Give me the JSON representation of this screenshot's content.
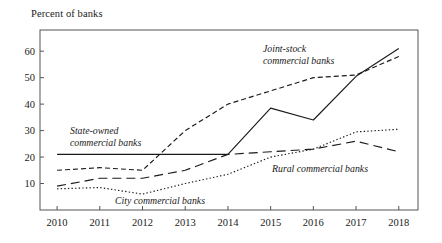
{
  "chart_data": {
    "type": "line",
    "title": "",
    "ylabel": "Percent of banks",
    "xlabel": "",
    "x": [
      2010,
      2011,
      2012,
      2013,
      2014,
      2015,
      2016,
      2017,
      2018
    ],
    "xtick_labels": [
      "2010",
      "2011",
      "2012",
      "2013",
      "2014",
      "2015",
      "2016",
      "2017",
      "2018"
    ],
    "ytick_labels": [
      "10",
      "20",
      "30",
      "40",
      "50",
      "60"
    ],
    "yticks": [
      10,
      20,
      30,
      40,
      50,
      60
    ],
    "ylim": [
      0,
      68
    ],
    "xlim": [
      2009.6,
      2018.45
    ],
    "grid": false,
    "legend_position": "inline-annotations",
    "series": [
      {
        "name": "State-owned commercial banks",
        "style": "solid",
        "values": [
          21,
          21,
          21,
          21,
          21,
          38.5,
          34,
          50.5,
          61
        ]
      },
      {
        "name": "Joint-stock commercial banks",
        "style": "short-dashed",
        "values": [
          15,
          16,
          15,
          30,
          40,
          45,
          50,
          51,
          58
        ]
      },
      {
        "name": "Rural commercial banks",
        "style": "long-dashed",
        "values": [
          9,
          12,
          12,
          15,
          21,
          22,
          23,
          26,
          22
        ]
      },
      {
        "name": "City commercial banks",
        "style": "dotted",
        "values": [
          8,
          8.5,
          6,
          10,
          13.5,
          20,
          23,
          29.5,
          30.5
        ]
      }
    ],
    "annotations": [
      {
        "id": "state-owned",
        "lines": [
          "State-owned",
          "commercial banks"
        ],
        "x": 70,
        "y": 134,
        "anchor": "start"
      },
      {
        "id": "joint-stock",
        "lines": [
          "Joint-stock",
          "commercial banks"
        ],
        "x": 263,
        "y": 52,
        "anchor": "start"
      },
      {
        "id": "rural",
        "lines": [
          "Rural commercial banks"
        ],
        "x": 272,
        "y": 172,
        "anchor": "start"
      },
      {
        "id": "city",
        "lines": [
          "City commercial banks"
        ],
        "x": 115,
        "y": 204,
        "anchor": "start"
      }
    ]
  }
}
